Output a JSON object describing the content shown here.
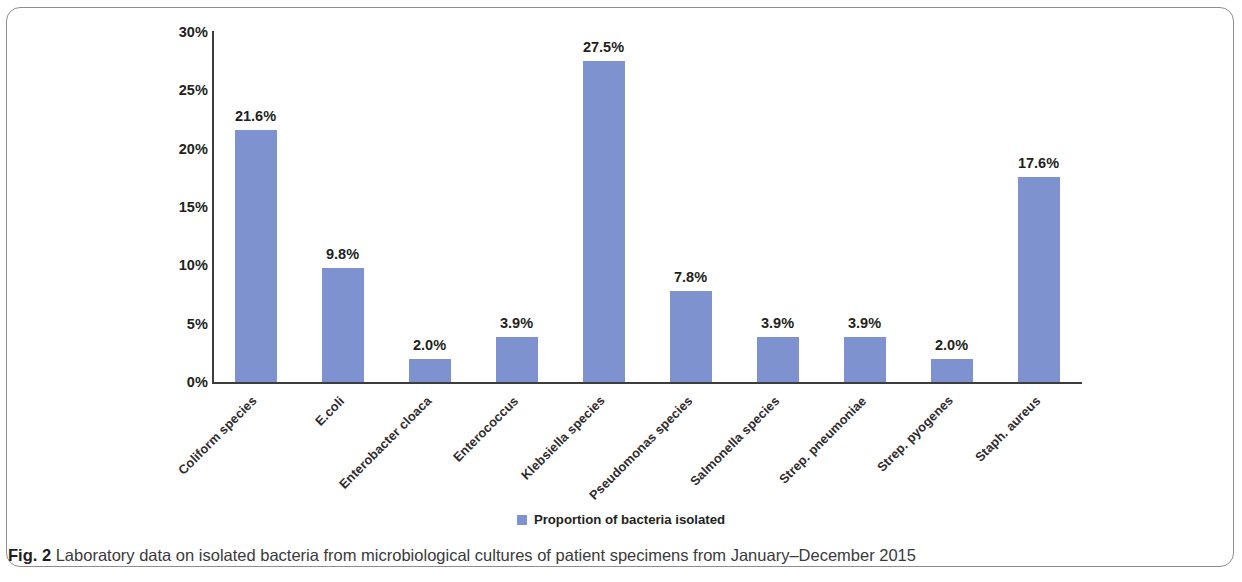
{
  "figure": {
    "label": "Fig. 2",
    "caption": "Laboratory data on isolated bacteria from microbiological cultures of patient specimens from January–December 2015"
  },
  "legend": {
    "entries": [
      {
        "label": "Proportion of bacteria isolated",
        "color": "#7e92cf"
      }
    ]
  },
  "axis": {
    "y_ticks": [
      "0%",
      "5%",
      "10%",
      "15%",
      "20%",
      "25%",
      "30%"
    ]
  },
  "chart_data": {
    "type": "bar",
    "title": "",
    "subtitle": "",
    "xlabel": "",
    "ylabel": "",
    "ylim": [
      0,
      30
    ],
    "ytick_values": [
      0,
      5,
      10,
      15,
      20,
      25,
      30
    ],
    "ytick_labels": [
      "0%",
      "5%",
      "10%",
      "15%",
      "20%",
      "25%",
      "30%"
    ],
    "grid": false,
    "legend_position": "bottom-center",
    "bar_color": "#7e92cf",
    "value_label_format": "0.0%",
    "categories": [
      "Coliform species",
      "E.coli",
      "Enterobacter cloaca",
      "Enterococcus",
      "Klebsiella species",
      "Pseudomonas species",
      "Salmonella species",
      "Strep. pneumoniae",
      "Strep. pyogenes",
      "Staph. aureus"
    ],
    "series": [
      {
        "name": "Proportion of bacteria isolated",
        "values": [
          21.6,
          9.8,
          2.0,
          3.9,
          27.5,
          7.8,
          3.9,
          3.9,
          2.0,
          17.6
        ]
      }
    ],
    "value_labels": [
      "21.6%",
      "9.8%",
      "2.0%",
      "3.9%",
      "27.5%",
      "7.8%",
      "3.9%",
      "3.9%",
      "2.0%",
      "17.6%"
    ]
  }
}
